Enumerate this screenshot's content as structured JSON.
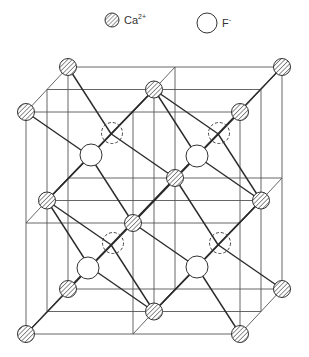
{
  "legend": {
    "items": [
      {
        "symbol": "Ca",
        "charge": "2+",
        "style": "hatched-circle",
        "x": 106
      },
      {
        "symbol": "F",
        "charge": "-",
        "style": "open-circle",
        "x": 199
      }
    ]
  },
  "diagram": {
    "colors": {
      "line": "#2a2a2a",
      "grid": "#555555",
      "fill": "#ffffff",
      "hatch": "#555555"
    },
    "cube": {
      "front_left": 26,
      "front_right": 240,
      "front_top": 112,
      "front_bottom": 334,
      "depth_dx": 42,
      "depth_dy": -45
    },
    "ca_positions": [
      [
        67,
        67
      ],
      [
        284,
        66
      ],
      [
        25,
        112
      ],
      [
        240,
        112
      ],
      [
        154,
        89
      ],
      [
        47,
        200
      ],
      [
        263,
        200
      ],
      [
        130,
        222
      ],
      [
        177,
        180
      ],
      [
        68,
        290
      ],
      [
        284,
        287
      ],
      [
        27,
        334
      ],
      [
        239,
        334
      ],
      [
        154,
        312
      ]
    ],
    "f_front": [
      [
        91,
        155
      ],
      [
        197,
        156
      ],
      [
        88,
        268
      ],
      [
        197,
        267
      ]
    ],
    "f_back_hidden": [
      [
        112,
        133
      ],
      [
        219,
        133
      ],
      [
        113,
        243
      ],
      [
        220,
        243
      ]
    ]
  }
}
